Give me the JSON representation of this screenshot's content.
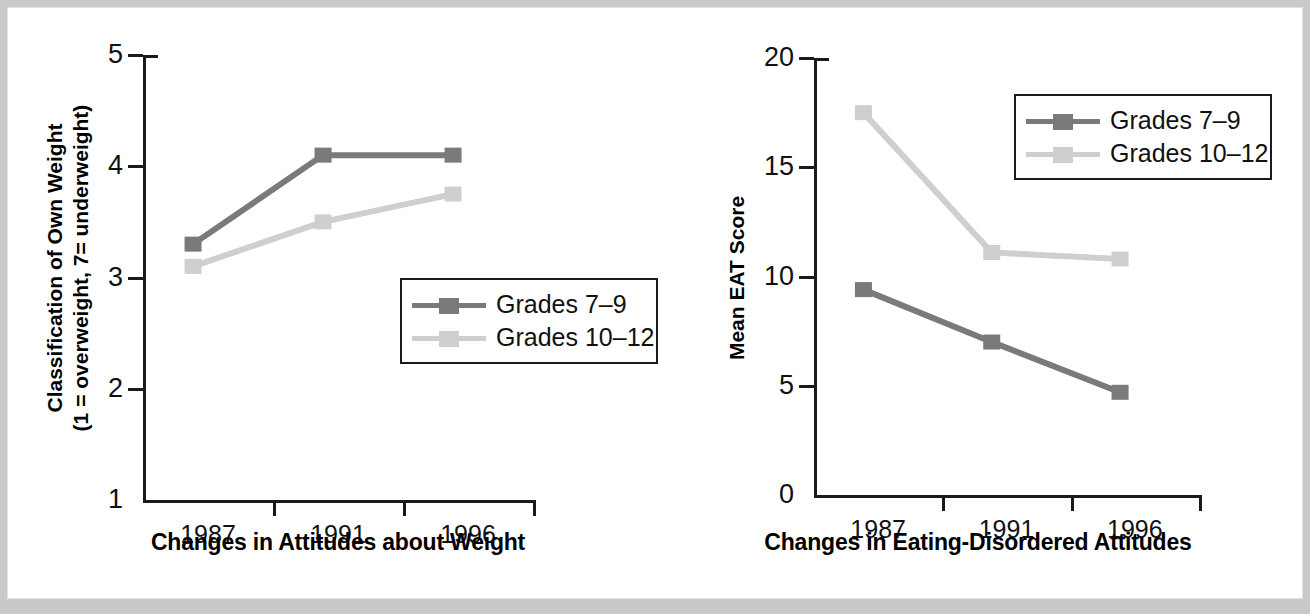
{
  "figure": {
    "background": "#ffffff",
    "page_background": "#c9c9c9"
  },
  "colors": {
    "series_dark": "#7a7a7a",
    "series_light": "#cfcfcf",
    "axis": "#1a1a1a",
    "text": "#111111"
  },
  "legend": {
    "entries": [
      {
        "label": "Grades 7–9",
        "color_key": "series_dark"
      },
      {
        "label": "Grades 10–12",
        "color_key": "series_light"
      }
    ]
  },
  "chart_data": [
    {
      "id": "left",
      "type": "line",
      "title": "",
      "xlabel": "Changes in Attitudes about Weight",
      "ylabel": "Classification of Own Weight\n(1 = overweight, 7= underweight)",
      "ylabel_line1": "Classification of Own Weight",
      "ylabel_line2": "(1 = overweight, 7= underweight)",
      "categories": [
        "1987",
        "1991",
        "1996"
      ],
      "yticks": [
        "5",
        "4",
        "3",
        "2",
        "1"
      ],
      "ytick_values": [
        5,
        4,
        3,
        2,
        1
      ],
      "ylim": [
        1,
        5
      ],
      "grid": false,
      "legend_position": "lower-right",
      "series": [
        {
          "name": "Grades 7–9",
          "color_key": "series_dark",
          "values": [
            3.3,
            4.1,
            4.1
          ]
        },
        {
          "name": "Grades 10–12",
          "color_key": "series_light",
          "values": [
            3.1,
            3.5,
            3.75
          ]
        }
      ]
    },
    {
      "id": "right",
      "type": "line",
      "title": "",
      "xlabel": "Changes in Eating-Disordered Attitudes",
      "ylabel": "Mean EAT Score",
      "ylabel_line1": "Mean EAT Score",
      "ylabel_line2": "",
      "categories": [
        "1987",
        "1991",
        "1996"
      ],
      "yticks": [
        "20",
        "15",
        "10",
        "5",
        "0"
      ],
      "ytick_values": [
        20,
        15,
        10,
        5,
        0
      ],
      "ylim": [
        0,
        20
      ],
      "grid": false,
      "legend_position": "upper-right",
      "series": [
        {
          "name": "Grades 7–9",
          "color_key": "series_dark",
          "values": [
            9.4,
            7.0,
            4.7
          ]
        },
        {
          "name": "Grades 10–12",
          "color_key": "series_light",
          "values": [
            17.5,
            11.1,
            10.8
          ]
        }
      ]
    }
  ]
}
